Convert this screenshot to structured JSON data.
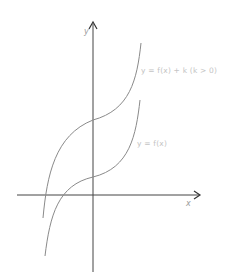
{
  "diagram": {
    "title": "",
    "axes": {
      "x_label": "x",
      "y_label": "y"
    },
    "curves": [
      {
        "name": "shifted",
        "label": "y = f(x) + k (k > 0)",
        "color": "#8a8a8a"
      },
      {
        "name": "original",
        "label": "y = f(x)",
        "color": "#8a8a8a"
      }
    ],
    "colors": {
      "axis": "#333333",
      "curve": "#8a8a8a",
      "label": "#c4c4c4"
    }
  }
}
